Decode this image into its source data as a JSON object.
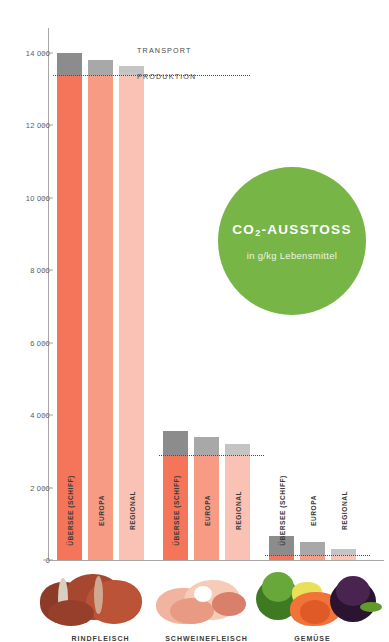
{
  "badge": {
    "title_main": "CO",
    "title_sub": "2",
    "title_rest": "-AUSSTOSS",
    "subtitle": "in g/kg Lebensmittel",
    "color": "#76b546"
  },
  "legend": {
    "transport": "TRANSPORT",
    "produktion": "PRODUKTION",
    "transport_color": "#8c8c8c",
    "produktion_color": "#f5755a"
  },
  "axis": {
    "ticks": [
      "14 000",
      "12 000",
      "10 000",
      "8 000",
      "6 000",
      "4 000",
      "2 000",
      "0"
    ],
    "unit": "g/kg"
  },
  "categories": {
    "beef": "RINDFLEISCH",
    "pork": "SCHWEINEFLEISCH",
    "veg": "GEMÜSE"
  },
  "series_labels": {
    "uebersee": "ÜBERSEE (SCHIFF)",
    "europa": "EUROPA",
    "regional": "REGIONAL"
  },
  "chart_data": {
    "type": "bar",
    "title": "CO2-AUSSTOSS",
    "subtitle": "in g/kg Lebensmittel",
    "xlabel": "",
    "ylabel": "in g/kg Lebensmittel",
    "ylim": [
      0,
      14000
    ],
    "yticks": [
      0,
      2000,
      4000,
      6000,
      8000,
      10000,
      12000,
      14000
    ],
    "grid": false,
    "legend": [
      "TRANSPORT",
      "PRODUKTION"
    ],
    "legend_position": "top-right-of-first-group",
    "stacked": true,
    "categories": [
      "RINDFLEISCH",
      "SCHWEINEFLEISCH",
      "GEMÜSE"
    ],
    "subgroups": [
      "ÜBERSEE (SCHIFF)",
      "EUROPA",
      "REGIONAL"
    ],
    "groups": [
      {
        "category": "RINDFLEISCH",
        "bars": [
          {
            "label": "ÜBERSEE (SCHIFF)",
            "produktion": 13400,
            "transport": 600,
            "total": 14000,
            "color": "#f5755a",
            "transport_color": "#8c8c8c"
          },
          {
            "label": "EUROPA",
            "produktion": 13400,
            "transport": 400,
            "total": 13800,
            "color": "#f89b85",
            "transport_color": "#a8a8a8"
          },
          {
            "label": "REGIONAL",
            "produktion": 13400,
            "transport": 250,
            "total": 13650,
            "color": "#fac2b5",
            "transport_color": "#c4c4c4"
          }
        ]
      },
      {
        "category": "SCHWEINEFLEISCH",
        "bars": [
          {
            "label": "ÜBERSEE (SCHIFF)",
            "produktion": 2900,
            "transport": 650,
            "total": 3550,
            "color": "#f5755a",
            "transport_color": "#8c8c8c"
          },
          {
            "label": "EUROPA",
            "produktion": 2900,
            "transport": 500,
            "total": 3400,
            "color": "#f89b85",
            "transport_color": "#a8a8a8"
          },
          {
            "label": "REGIONAL",
            "produktion": 2900,
            "transport": 300,
            "total": 3200,
            "color": "#fac2b5",
            "transport_color": "#c4c4c4"
          }
        ]
      },
      {
        "category": "GEMÜSE",
        "bars": [
          {
            "label": "ÜBERSEE (SCHIFF)",
            "produktion": 150,
            "transport": 500,
            "total": 650,
            "color": "#f5755a",
            "transport_color": "#8c8c8c"
          },
          {
            "label": "EUROPA",
            "produktion": 150,
            "transport": 350,
            "total": 500,
            "color": "#f89b85",
            "transport_color": "#a8a8a8"
          },
          {
            "label": "REGIONAL",
            "produktion": 150,
            "transport": 150,
            "total": 300,
            "color": "#fac2b5",
            "transport_color": "#c4c4c4"
          }
        ]
      }
    ]
  }
}
